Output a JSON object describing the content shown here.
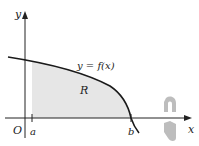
{
  "figure": {
    "axis_labels": {
      "x": "x",
      "y": "y",
      "origin": "O"
    },
    "curve_label": "y = f(x)",
    "region_label": "R",
    "bounds": {
      "left": "a",
      "right": "b"
    },
    "colors": {
      "axis": "#222222",
      "curve": "#1a1a1a",
      "region_fill": "#e6e6e6",
      "rotation_arrow": "#bdbdbd"
    },
    "rotation_indicator": "rotation-about-x-axis"
  }
}
